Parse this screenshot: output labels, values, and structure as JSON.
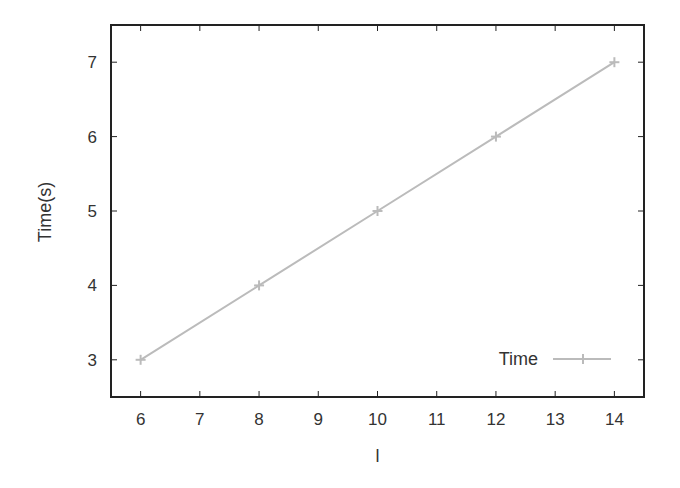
{
  "chart_data": {
    "type": "line",
    "title": "",
    "xlabel": "l",
    "ylabel": "Time(s)",
    "xlim": [
      5.5,
      14.5
    ],
    "ylim": [
      2.5,
      7.5
    ],
    "xticks": [
      6,
      7,
      8,
      9,
      10,
      11,
      12,
      13,
      14
    ],
    "yticks": [
      3,
      4,
      5,
      6,
      7
    ],
    "grid": false,
    "legend_position": "lower right",
    "series": [
      {
        "name": "Time",
        "marker": "+",
        "color": "#bbbbbb",
        "x": [
          6,
          8,
          10,
          12,
          14
        ],
        "y": [
          3,
          4,
          5,
          6,
          7
        ]
      }
    ]
  },
  "colors": {
    "frame": "#222222",
    "text": "#333333",
    "series": "#bbbbbb",
    "background": "#ffffff"
  }
}
